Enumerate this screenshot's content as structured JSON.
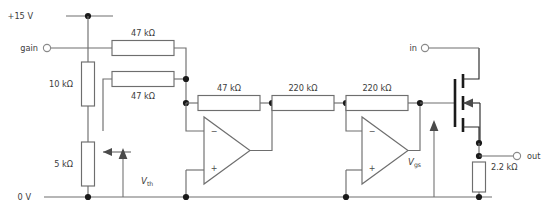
{
  "diagram": {
    "background_color": "#ffffff",
    "wire_color": "#6e6e6e",
    "node_color": "#1a1a1a",
    "text_color": "#3c3c3c"
  },
  "rails": {
    "positive_label": "+15 V",
    "ground_label": "0 V"
  },
  "terminals": {
    "gain": "gain",
    "input": "in",
    "output": "out"
  },
  "signals": {
    "v_th_symbol": "V",
    "v_th_subscript": "th",
    "v_gs_symbol": "V",
    "v_gs_subscript": "gs"
  },
  "resistors": [
    {
      "id": "r-feedback-top",
      "label": "47 kΩ",
      "orientation": "horizontal"
    },
    {
      "id": "r-feedback-lower",
      "label": "47 kΩ",
      "orientation": "horizontal"
    },
    {
      "id": "r-divider-10k",
      "label": "10 kΩ",
      "orientation": "vertical"
    },
    {
      "id": "r-pot-5k",
      "label": "5 kΩ",
      "orientation": "vertical"
    },
    {
      "id": "r-input-47k",
      "label": "47 kΩ",
      "orientation": "horizontal"
    },
    {
      "id": "r-stage1-220k",
      "label": "220 kΩ",
      "orientation": "horizontal"
    },
    {
      "id": "r-stage2-220k",
      "label": "220 kΩ",
      "orientation": "horizontal"
    },
    {
      "id": "r-load-2k2",
      "label": "2.2 kΩ",
      "orientation": "vertical"
    }
  ],
  "opamps": [
    {
      "id": "opamp-1",
      "minus": "−",
      "plus": "+"
    },
    {
      "id": "opamp-2",
      "minus": "−",
      "plus": "+"
    }
  ],
  "transistor": {
    "id": "mosfet-q1",
    "type": "n-channel-mosfet"
  }
}
